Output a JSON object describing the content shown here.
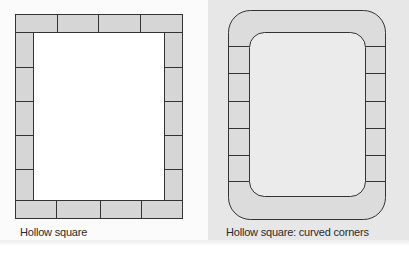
{
  "figures": [
    {
      "id": "hollow-square",
      "caption": "Hollow square",
      "style": "square corners, bricks laid as a rectangular frame",
      "top_row_bricks": 4,
      "bottom_row_bricks": 4,
      "left_column_bricks": 5,
      "right_column_bricks": 5
    },
    {
      "id": "hollow-square-curved",
      "caption": "Hollow square: curved corners",
      "style": "rounded frame; curved solid top and bottom bands",
      "left_column_bricks": 5,
      "right_column_bricks": 5
    }
  ],
  "colors": {
    "brick_fill": "#d6d6d6",
    "curved_band_fill": "#dcdcdc",
    "curved_inner_fill": "#ebebeb",
    "outline": "#333333",
    "right_panel_bg": "#e7e7e7",
    "left_panel_bg": "#fbfbfb"
  }
}
